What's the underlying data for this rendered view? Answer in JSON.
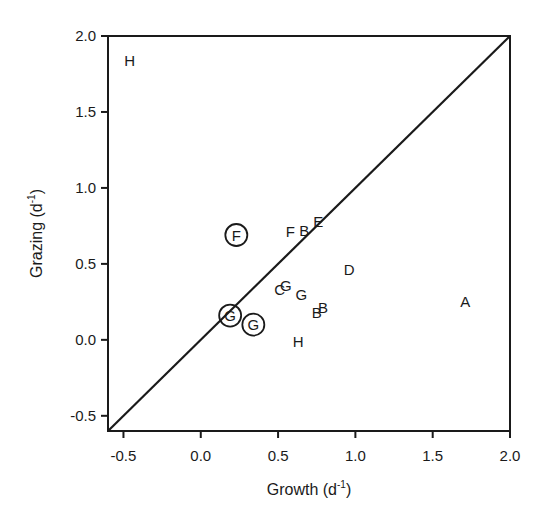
{
  "chart_data": {
    "type": "scatter",
    "title": "",
    "xlabel": "Growth (d",
    "xlabel_sup": "-1",
    "xlabel_close": ")",
    "ylabel": "Grazing (d",
    "ylabel_sup": "-1",
    "ylabel_close": ")",
    "xlim": [
      -0.6,
      2.0
    ],
    "ylim": [
      -0.6,
      2.0
    ],
    "xticks": [
      -0.5,
      0.0,
      0.5,
      1.0,
      1.5,
      2.0
    ],
    "yticks": [
      -0.5,
      0.0,
      0.5,
      1.0,
      1.5,
      2.0
    ],
    "xtick_labels": [
      "-0.5",
      "0.0",
      "0.5",
      "1.0",
      "1.5",
      "2.0"
    ],
    "ytick_labels": [
      "-0.5",
      "0.0",
      "0.5",
      "1.0",
      "1.5",
      "2.0"
    ],
    "grid": false,
    "legend": "none",
    "reference_line": {
      "label": "1:1 line",
      "from": [
        -0.6,
        -0.6
      ],
      "to": [
        2.0,
        2.0
      ]
    },
    "points": [
      {
        "label": "H",
        "x": -0.46,
        "y": 1.84,
        "circled": false
      },
      {
        "label": "F",
        "x": 0.23,
        "y": 0.69,
        "circled": true
      },
      {
        "label": "F",
        "x": 0.58,
        "y": 0.71,
        "circled": false
      },
      {
        "label": "B",
        "x": 0.67,
        "y": 0.72,
        "circled": false
      },
      {
        "label": "E",
        "x": 0.76,
        "y": 0.78,
        "circled": false
      },
      {
        "label": "D",
        "x": 0.96,
        "y": 0.46,
        "circled": false
      },
      {
        "label": "C",
        "x": 0.51,
        "y": 0.33,
        "circled": false
      },
      {
        "label": "G",
        "x": 0.55,
        "y": 0.36,
        "circled": false
      },
      {
        "label": "G",
        "x": 0.65,
        "y": 0.3,
        "circled": false
      },
      {
        "label": "B",
        "x": 0.75,
        "y": 0.18,
        "circled": false
      },
      {
        "label": "B",
        "x": 0.79,
        "y": 0.21,
        "circled": false
      },
      {
        "label": "A",
        "x": 1.71,
        "y": 0.25,
        "circled": false
      },
      {
        "label": "G",
        "x": 0.19,
        "y": 0.16,
        "circled": true
      },
      {
        "label": "G",
        "x": 0.34,
        "y": 0.1,
        "circled": true
      },
      {
        "label": "H",
        "x": 0.63,
        "y": -0.01,
        "circled": false
      }
    ]
  }
}
